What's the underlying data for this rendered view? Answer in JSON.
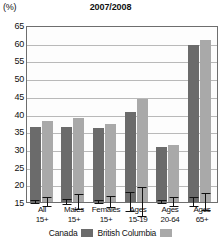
{
  "axis_unit": "(%)",
  "title": "2007/2008",
  "legend": {
    "canada": "Canada",
    "bc": "British Columbia"
  },
  "chart_data": {
    "type": "bar",
    "title": "2007/2008",
    "xlabel": "",
    "ylabel": "(%)",
    "ylim": [
      15,
      65
    ],
    "yticks": [
      65,
      60,
      55,
      50,
      45,
      40,
      35,
      30,
      25,
      20,
      15
    ],
    "grid": true,
    "legend_position": "bottom",
    "categories": [
      "All 15+",
      "Males 15+",
      "Females 15+",
      "Ages 15-19",
      "Ages 20-64",
      "Ages 65+"
    ],
    "category_lines": [
      [
        "All",
        "15+"
      ],
      [
        "Males",
        "15+"
      ],
      [
        "Females",
        "15+"
      ],
      [
        "Ages",
        "15-19"
      ],
      [
        "Ages",
        "20-64"
      ],
      [
        "Ages",
        "65+"
      ]
    ],
    "series": [
      {
        "name": "Canada",
        "color": "#6b6b6b",
        "values": [
          36.2,
          36.3,
          35.9,
          40.5,
          30.5,
          59.3
        ],
        "error_low": [
          35.6,
          35.4,
          35.2,
          37.8,
          29.9,
          57.9
        ],
        "error_high": [
          36.8,
          37.2,
          36.6,
          43.2,
          31.1,
          60.7
        ]
      },
      {
        "name": "British Columbia",
        "color": "#a9a9a9",
        "values": [
          37.8,
          38.6,
          36.9,
          44.2,
          31.2,
          60.8
        ],
        "error_low": [
          36.3,
          36.4,
          35.3,
          40.0,
          29.9,
          58.3
        ],
        "error_high": [
          39.3,
          40.8,
          38.5,
          48.4,
          32.5,
          63.3
        ]
      }
    ]
  }
}
